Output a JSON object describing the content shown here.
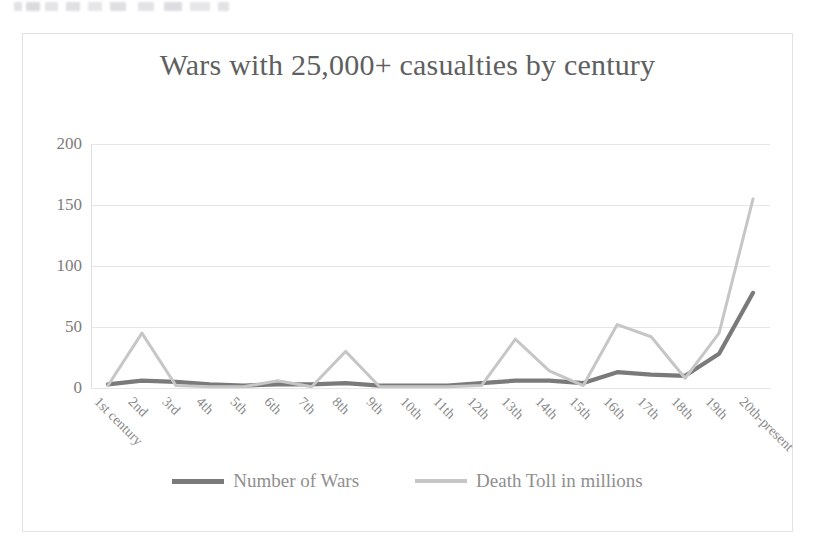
{
  "chart_data": {
    "type": "line",
    "title": "Wars with 25,000+ casualties by century",
    "xlabel": "",
    "ylabel": "",
    "ylim": [
      0,
      200
    ],
    "yticks": [
      0,
      50,
      100,
      150,
      200
    ],
    "grid": true,
    "legend_position": "bottom",
    "categories": [
      "1st century",
      "2nd",
      "3rd",
      "4th",
      "5th",
      "6th",
      "7th",
      "8th",
      "9th",
      "10th",
      "11th",
      "12th",
      "13th",
      "14th",
      "15th",
      "16th",
      "17th",
      "18th",
      "19th",
      "20th-present"
    ],
    "series": [
      {
        "name": "Number of Wars",
        "color": "#7a7a7a",
        "values": [
          3,
          6,
          5,
          3,
          2,
          3,
          3,
          4,
          2,
          2,
          2,
          4,
          6,
          6,
          4,
          13,
          11,
          10,
          28,
          78
        ]
      },
      {
        "name": "Death Toll in millions",
        "color": "#c6c6c6",
        "values": [
          2,
          45,
          2,
          1,
          1,
          6,
          1,
          30,
          1,
          1,
          1,
          2,
          40,
          14,
          2,
          52,
          42,
          8,
          45,
          155
        ]
      }
    ]
  },
  "chart": {
    "title": "Wars with 25,000+ casualties by century",
    "legend": [
      {
        "label": "Number of Wars",
        "swatch": "wars",
        "color": "#7a7a7a"
      },
      {
        "label": "Death Toll in millions",
        "swatch": "deaths",
        "color": "#c6c6c6"
      }
    ]
  }
}
